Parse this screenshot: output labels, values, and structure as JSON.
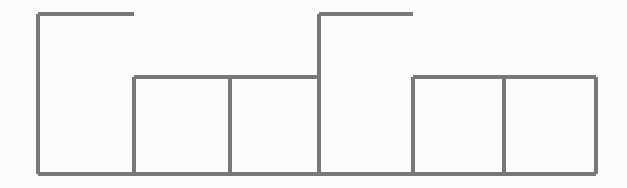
{
  "figure": {
    "title": "",
    "caption": "",
    "background_color": "#fcfcfa",
    "stroke_color": "#787878",
    "stroke_width": 4,
    "width": 627,
    "height": 188
  },
  "chart_data": {
    "type": "bar",
    "title": "",
    "subtitle": "",
    "xlabel": "",
    "ylabel": "",
    "grid": false,
    "legend": null,
    "legend_position": "none",
    "axis_visible": false,
    "tick_labels_visible": false,
    "style": "outline-only histogram, adjacent bars sharing edges, no axes or labels",
    "categories": [
      "1",
      "2",
      "3",
      "4",
      "5",
      "6"
    ],
    "values": [
      160,
      97,
      97,
      160,
      97,
      97
    ],
    "value_units": "pixels of bar height above baseline",
    "ylim": [
      0,
      174
    ],
    "xlim": [
      38,
      596
    ],
    "baseline_y": 174,
    "bar_edges_x": [
      38,
      134,
      230,
      319,
      413,
      504,
      596
    ],
    "bar_tops_y": [
      14,
      77,
      77,
      14,
      77,
      77
    ],
    "bars": [
      {
        "index": 1,
        "x_left": 38,
        "x_right": 134,
        "y_top": 14,
        "height": 160,
        "width": 96,
        "level": "tall"
      },
      {
        "index": 2,
        "x_left": 134,
        "x_right": 230,
        "y_top": 77,
        "height": 97,
        "width": 96,
        "level": "short"
      },
      {
        "index": 3,
        "x_left": 230,
        "x_right": 319,
        "y_top": 77,
        "height": 97,
        "width": 89,
        "level": "short"
      },
      {
        "index": 4,
        "x_left": 319,
        "x_right": 413,
        "y_top": 14,
        "height": 160,
        "width": 94,
        "level": "tall"
      },
      {
        "index": 5,
        "x_left": 413,
        "x_right": 504,
        "y_top": 77,
        "height": 97,
        "width": 91,
        "level": "short"
      },
      {
        "index": 6,
        "x_left": 504,
        "x_right": 596,
        "y_top": 77,
        "height": 97,
        "width": 92,
        "level": "short"
      }
    ]
  }
}
